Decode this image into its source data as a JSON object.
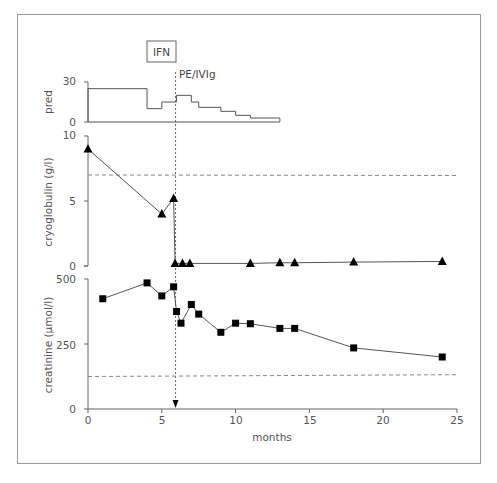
{
  "chart_data": [
    {
      "panel": "pred",
      "type": "line",
      "step": true,
      "ylabel": "pred",
      "ylim": [
        0,
        30
      ],
      "yticks": [
        0,
        30
      ],
      "xlim": [
        0,
        25
      ],
      "series": [
        {
          "name": "pred",
          "x": [
            0,
            4,
            5,
            6,
            7,
            7.5,
            9,
            10,
            11,
            13
          ],
          "values": [
            25,
            10,
            15,
            20,
            15,
            11,
            8,
            5,
            3,
            0
          ]
        }
      ]
    },
    {
      "panel": "cryoglobulin",
      "type": "line",
      "ylabel": "cryoglobulin (g/l)",
      "ylim": [
        0,
        10
      ],
      "yticks": [
        0,
        5,
        10
      ],
      "xlim": [
        0,
        25
      ],
      "marker": "triangle",
      "reference_line": 7.0,
      "series": [
        {
          "name": "cryoglobulin",
          "x": [
            0,
            5,
            5.8,
            5.9,
            6.4,
            6.9,
            11,
            13,
            14,
            18,
            24
          ],
          "values": [
            9.0,
            4.0,
            5.2,
            0.2,
            0.2,
            0.2,
            0.2,
            0.25,
            0.25,
            0.3,
            0.35
          ]
        }
      ]
    },
    {
      "panel": "creatinine",
      "type": "line",
      "ylabel": "creatinine (µmol/l)",
      "xlabel": "months",
      "ylim": [
        0,
        500
      ],
      "yticks": [
        0,
        250,
        500
      ],
      "xlim": [
        0,
        25
      ],
      "xticks": [
        0,
        5,
        10,
        15,
        20,
        25
      ],
      "marker": "square",
      "reference_line": [
        125,
        132
      ],
      "series": [
        {
          "name": "creatinine",
          "x": [
            1,
            4,
            5,
            5.8,
            6,
            6.3,
            7,
            7.5,
            9,
            10,
            11,
            13,
            14,
            18,
            24
          ],
          "values": [
            424,
            485,
            435,
            470,
            375,
            330,
            402,
            365,
            295,
            330,
            328,
            310,
            310,
            235,
            200
          ]
        }
      ]
    }
  ],
  "annotations": {
    "ifn_label": "IFN",
    "pe_label": "PE/IVIg",
    "event_month": 6
  },
  "axes": {
    "pred_ticks": [
      "30",
      "0"
    ],
    "cryo_ticks": [
      "10",
      "5",
      "0"
    ],
    "creat_ticks": [
      "500",
      "250",
      "0"
    ],
    "x_ticks": [
      "0",
      "5",
      "10",
      "15",
      "20",
      "25"
    ],
    "x_title": "months",
    "pred_title": "pred",
    "cryo_title": "cryoglobulin (g/l)",
    "creat_title": "creatinine (µmol/l)"
  },
  "colors": {
    "line": "#555555",
    "marker": "#000000",
    "axis": "#666666",
    "dashed": "#888888"
  }
}
